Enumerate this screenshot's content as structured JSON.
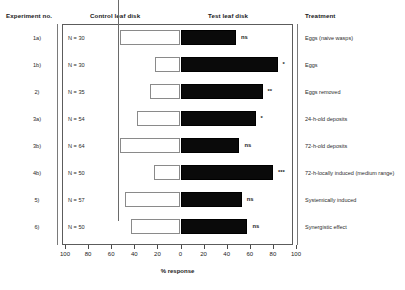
{
  "headers": {
    "experiment": "Experiment no.",
    "control": "Control leaf disk",
    "test": "Test leaf disk",
    "treatment": "Treatment"
  },
  "axis": {
    "title": "% response",
    "ticks": [
      "100",
      "80",
      "60",
      "40",
      "20",
      "0",
      "20",
      "40",
      "60",
      "80",
      "100"
    ],
    "max": 100
  },
  "chart_data": {
    "type": "bar",
    "orientation": "horizontal",
    "style": "diverging-paired",
    "title": "",
    "xlabel": "% response",
    "ylabel": "",
    "xlim": [
      -100,
      100
    ],
    "grid": false,
    "legend": false,
    "axis_tick_labels": [
      "100",
      "80",
      "60",
      "40",
      "20",
      "0",
      "20",
      "40",
      "60",
      "80",
      "100"
    ],
    "categories": [
      "1a)",
      "1b)",
      "2)",
      "3a)",
      "3b)",
      "4b)",
      "5)",
      "6)"
    ],
    "series": [
      {
        "name": "Control leaf disk",
        "values": [
          52,
          22,
          26,
          38,
          52,
          23,
          48,
          43
        ]
      },
      {
        "name": "Test leaf disk",
        "values": [
          48,
          84,
          71,
          65,
          51,
          80,
          53,
          58
        ]
      }
    ],
    "rows": [
      {
        "experiment": "1a)",
        "n_label": "N = 30",
        "n": 30,
        "control": 52,
        "test": 48,
        "significance": "ns",
        "treatment": "Eggs (naive wasps)"
      },
      {
        "experiment": "1b)",
        "n_label": "N = 30",
        "n": 30,
        "control": 22,
        "test": 84,
        "significance": "*",
        "treatment": "Eggs"
      },
      {
        "experiment": "2)",
        "n_label": "N = 35",
        "n": 35,
        "control": 26,
        "test": 71,
        "significance": "**",
        "treatment": "Eggs removed"
      },
      {
        "experiment": "3a)",
        "n_label": "N = 54",
        "n": 54,
        "control": 38,
        "test": 65,
        "significance": "*",
        "treatment": "24-h-old deposits"
      },
      {
        "experiment": "3b)",
        "n_label": "N = 64",
        "n": 64,
        "control": 52,
        "test": 51,
        "significance": "ns",
        "treatment": "72-h-old deposits"
      },
      {
        "experiment": "4b)",
        "n_label": "N = 50",
        "n": 50,
        "control": 23,
        "test": 80,
        "significance": "***",
        "treatment": "72-h-locally induced (medium range)"
      },
      {
        "experiment": "5)",
        "n_label": "N = 57",
        "n": 57,
        "control": 48,
        "test": 53,
        "significance": "ns",
        "treatment": "Systemically induced"
      },
      {
        "experiment": "6)",
        "n_label": "N = 50",
        "n": 50,
        "control": 43,
        "test": 58,
        "significance": "ns",
        "treatment": "Synergistic effect"
      }
    ]
  }
}
